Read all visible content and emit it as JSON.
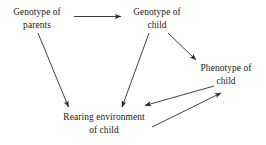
{
  "diagram": {
    "background_color": "#ffffff",
    "text_color": "#1a1a1a",
    "arrow_color": "#2b2b2b",
    "nodes": [
      {
        "id": "genotype-parents",
        "line1": "Genotype of",
        "line2": "parents"
      },
      {
        "id": "genotype-child",
        "line1": "Genotype of",
        "line2": "child"
      },
      {
        "id": "phenotype-child",
        "line1": "Phenotype of",
        "line2": "child"
      },
      {
        "id": "rearing-environment",
        "line1": "Rearing environment",
        "line2": "of child"
      }
    ],
    "edges": [
      {
        "id": "parents-to-genotype-child",
        "from": "genotype-parents",
        "to": "genotype-child",
        "style": "straight-horizontal"
      },
      {
        "id": "parents-to-rearing-environment",
        "from": "genotype-parents",
        "to": "rearing-environment",
        "style": "diagonal"
      },
      {
        "id": "genotype-child-to-rearing-environment",
        "from": "genotype-child",
        "to": "rearing-environment",
        "style": "diagonal"
      },
      {
        "id": "genotype-child-to-phenotype",
        "from": "genotype-child",
        "to": "phenotype-child",
        "style": "diagonal"
      },
      {
        "id": "phenotype-to-rearing-environment",
        "from": "phenotype-child",
        "to": "rearing-environment",
        "style": "diagonal"
      },
      {
        "id": "rearing-environment-to-phenotype",
        "from": "rearing-environment",
        "to": "phenotype-child",
        "style": "diagonal"
      }
    ]
  }
}
